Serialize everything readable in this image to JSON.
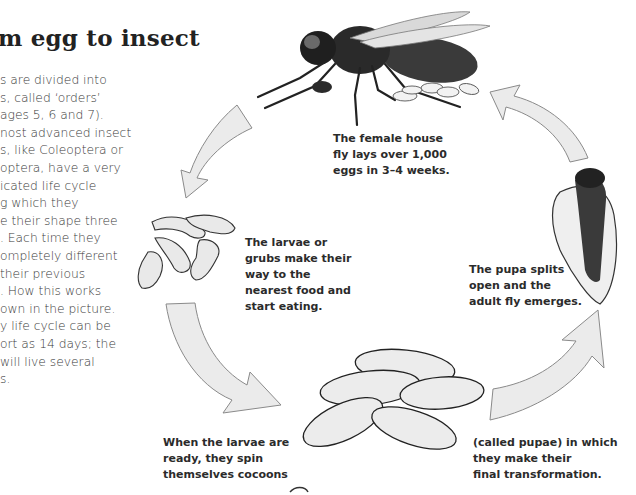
{
  "heading": "m egg to insect",
  "intro_lines": [
    "s are divided into",
    "s, called ‘orders’",
    "ages 5, 6 and 7).",
    "nost advanced insect",
    "s, like Coleoptera or",
    "optera, have a very",
    "icated life cycle",
    "g which they",
    "e their shape three",
    ". Each time they",
    "ompletely different",
    "their previous",
    ". How this works",
    "own in the picture.",
    "y life cycle can be",
    "ort as 14 days; the",
    " will live several",
    "s."
  ],
  "captions": {
    "adult": [
      "The female house",
      "fly lays over 1,000",
      "eggs in 3–4 weeks."
    ],
    "larvae": [
      "The larvae or",
      "grubs make their",
      "way to the",
      "nearest food and",
      "start eating."
    ],
    "pupa_emerge": [
      "The pupa splits",
      "open and the",
      "adult fly emerges."
    ],
    "cocoon_left": [
      "When the larvae are",
      "ready, they spin",
      "themselves cocoons"
    ],
    "cocoon_right": [
      "(called pupae) in which",
      "they make their",
      "final transformation."
    ]
  },
  "stages": [
    "adult-fly",
    "eggs",
    "larvae",
    "pupae-cocoons",
    "emerging-fly"
  ],
  "colors": {
    "arrow_fill": "#ebebeb",
    "arrow_stroke": "#8a8a8a",
    "text": "#2b2b2b",
    "fly_body": "#2e2e2e",
    "larva_fill": "#e9e9e9"
  }
}
